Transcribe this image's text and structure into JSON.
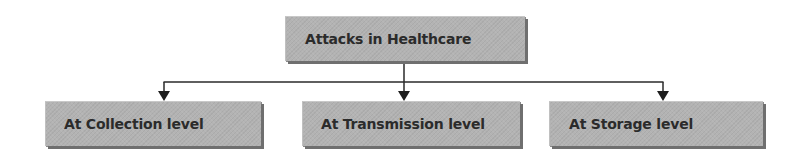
{
  "diagram": {
    "type": "hierarchy-tree",
    "root": {
      "label": "Attacks in Healthcare"
    },
    "children": [
      {
        "label": "At Collection level"
      },
      {
        "label": "At Transmission level"
      },
      {
        "label": "At Storage level"
      }
    ],
    "colors": {
      "node_fill": "#b3b3b3",
      "node_shadow": "#6f6f6f",
      "text": "#2b2b2b",
      "connector": "#2a2a2a"
    }
  }
}
